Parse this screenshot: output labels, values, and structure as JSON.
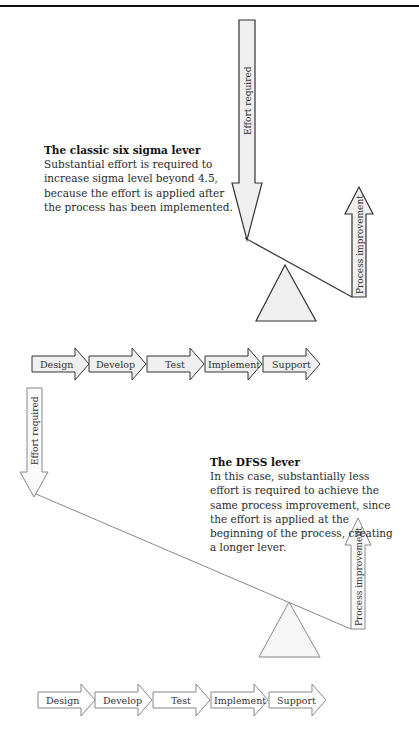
{
  "classic": {
    "title": "The classic six sigma lever",
    "body": "Substantial effort is required to increase sigma level beyond 4.5, because the effort is applied after the process has been implemented.",
    "effort_label": "Effort required",
    "improvement_label": "Process improvement",
    "stages": [
      "Design",
      "Develop",
      "Test",
      "Implement",
      "Support"
    ]
  },
  "dfss": {
    "title": "The DFSS lever",
    "body": "In this case, substantially less effort is required to achieve the same process improvement, since the effort is applied at the beginning of the process, creating a longer lever.",
    "effort_label": "Effort required",
    "improvement_label": "Process improvement",
    "stages": [
      "Design",
      "Develop",
      "Test",
      "Implement",
      "Support"
    ]
  },
  "colors": {
    "arrow_fill": "#efefef",
    "stroke_dark": "#333333",
    "stroke_light": "#888888"
  }
}
